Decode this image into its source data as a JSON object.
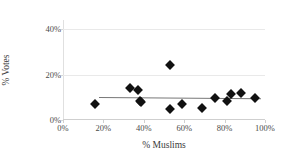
{
  "chart_data": {
    "type": "scatter",
    "title": "",
    "xlabel": "% Muslims",
    "ylabel": "% Votes",
    "xlim": [
      0,
      100
    ],
    "ylim": [
      0,
      44
    ],
    "xticks": [
      "0%",
      "20%",
      "40%",
      "60%",
      "80%",
      "100%"
    ],
    "xtick_values": [
      0,
      20,
      40,
      60,
      80,
      100
    ],
    "yticks": [
      "0%",
      "20%",
      "40%"
    ],
    "ytick_values": [
      0,
      20,
      40
    ],
    "grid": "horizontal",
    "legend": "none",
    "marker_shape": "diamond",
    "marker_color": "#111111",
    "trendline_color": "#777777",
    "gridline_color": "#e9e9e9",
    "points": [
      {
        "x": 16,
        "y": 7
      },
      {
        "x": 33,
        "y": 14
      },
      {
        "x": 37,
        "y": 13
      },
      {
        "x": 38,
        "y": 8.5
      },
      {
        "x": 38.5,
        "y": 7.8
      },
      {
        "x": 53,
        "y": 24
      },
      {
        "x": 53,
        "y": 5
      },
      {
        "x": 59,
        "y": 7
      },
      {
        "x": 69,
        "y": 5.5
      },
      {
        "x": 75,
        "y": 9.5
      },
      {
        "x": 81,
        "y": 8.5
      },
      {
        "x": 83,
        "y": 11.5
      },
      {
        "x": 88,
        "y": 12
      },
      {
        "x": 95,
        "y": 9.5
      }
    ],
    "trendline": {
      "x0": 18,
      "y0": 10.2,
      "x1": 98,
      "y1": 9.6
    }
  }
}
